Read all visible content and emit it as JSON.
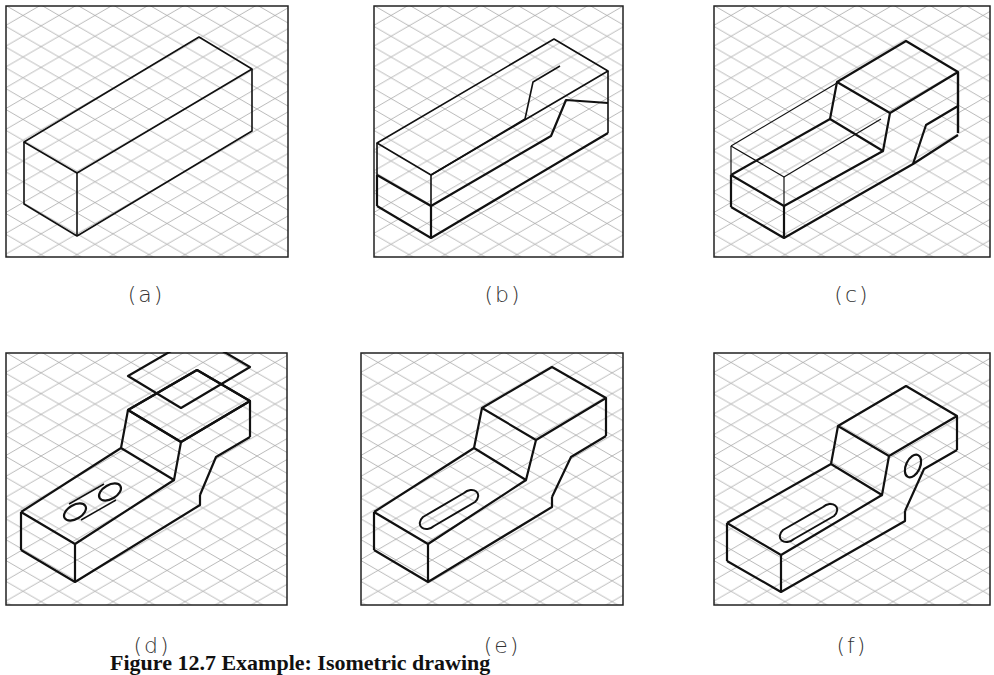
{
  "figure": {
    "caption": "Figure 12.7  Example: Isometric drawing",
    "panels": [
      {
        "id": "a",
        "label": "(a)",
        "description": "Isometric bounding box"
      },
      {
        "id": "b",
        "label": "(b)",
        "description": "Box with lower step and sloped cut on right face"
      },
      {
        "id": "c",
        "label": "(c)",
        "description": "Front portion of box cut down, raised block at rear"
      },
      {
        "id": "d",
        "label": "(d)",
        "description": "Stepped bracket with two circles marking slot ends"
      },
      {
        "id": "e",
        "label": "(e)",
        "description": "Stepped bracket with elongated slot"
      },
      {
        "id": "f",
        "label": "(f)",
        "description": "Stepped bracket with slot and hole in side face"
      }
    ]
  },
  "style": {
    "grid_color": "#9a9a9a",
    "line_color": "#111111",
    "background": "#ffffff"
  }
}
